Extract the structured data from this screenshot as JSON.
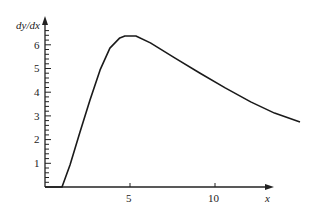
{
  "chart_data": {
    "type": "line",
    "title": "",
    "xlabel": "x",
    "ylabel": "dy/dx",
    "x_ticks": [
      5,
      10
    ],
    "y_ticks": [
      1,
      2,
      3,
      4,
      5,
      6
    ],
    "y_minor_step": 0.2,
    "xlim": [
      0,
      16.3
    ],
    "ylim": [
      0,
      6.8
    ],
    "grid": false,
    "series": [
      {
        "name": "dy/dx",
        "x": [
          0,
          1.0,
          1.47,
          2.06,
          2.65,
          3.24,
          3.82,
          4.4,
          4.7,
          5.35,
          6.2,
          7.65,
          9.1,
          10.6,
          12.1,
          13.5,
          15.0
        ],
        "y": [
          0,
          0,
          0.93,
          2.32,
          3.67,
          4.94,
          5.86,
          6.29,
          6.37,
          6.37,
          6.08,
          5.44,
          4.81,
          4.18,
          3.59,
          3.12,
          2.74
        ]
      }
    ]
  },
  "labels": {
    "ylabel": "dy/dx",
    "xlabel": "x",
    "xtick_5": "5",
    "xtick_10": "10",
    "ytick_1": "1",
    "ytick_2": "2",
    "ytick_3": "3",
    "ytick_4": "4",
    "ytick_5": "5",
    "ytick_6": "6"
  }
}
